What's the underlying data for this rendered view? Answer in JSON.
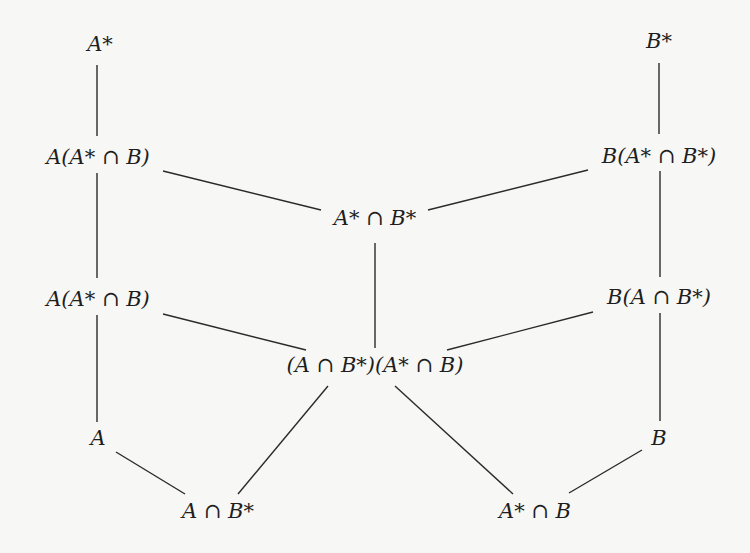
{
  "diagram": {
    "type": "hasse-diagram",
    "nodes": [
      {
        "id": "Astar",
        "label": "A*",
        "x": 100,
        "y": 44
      },
      {
        "id": "Bstar",
        "label": "B*",
        "x": 659,
        "y": 41
      },
      {
        "id": "A_AstarB",
        "label": "A(A* ∩ B)",
        "x": 98,
        "y": 157
      },
      {
        "id": "B_AstarBstar",
        "label": "B(A* ∩ B*)",
        "x": 659,
        "y": 156
      },
      {
        "id": "AstarBstar",
        "label": "A* ∩ B*",
        "x": 375,
        "y": 218
      },
      {
        "id": "A_AstarB_2",
        "label": "A(A* ∩ B)",
        "x": 98,
        "y": 299
      },
      {
        "id": "B_ABstar",
        "label": "B(A ∩ B*)",
        "x": 659,
        "y": 297
      },
      {
        "id": "middle",
        "label": "(A ∩ B*)(A* ∩ B)",
        "x": 375,
        "y": 365
      },
      {
        "id": "A",
        "label": "A",
        "x": 98,
        "y": 438
      },
      {
        "id": "B",
        "label": "B",
        "x": 659,
        "y": 438
      },
      {
        "id": "ABstar",
        "label": "A ∩ B*",
        "x": 218,
        "y": 511
      },
      {
        "id": "AstarB",
        "label": "A* ∩ B",
        "x": 535,
        "y": 511
      }
    ],
    "edges": [
      {
        "from": "Astar",
        "to": "A_AstarB",
        "x1": 97,
        "y1": 65,
        "x2": 97,
        "y2": 136
      },
      {
        "from": "Bstar",
        "to": "B_AstarBstar",
        "x1": 659,
        "y1": 63,
        "x2": 659,
        "y2": 134
      },
      {
        "from": "A_AstarB",
        "to": "AstarBstar",
        "x1": 163,
        "y1": 171,
        "x2": 321,
        "y2": 210
      },
      {
        "from": "B_AstarBstar",
        "to": "AstarBstar",
        "x1": 428,
        "y1": 210,
        "x2": 588,
        "y2": 170
      },
      {
        "from": "A_AstarB",
        "to": "A_AstarB_2",
        "x1": 97,
        "y1": 173,
        "x2": 97,
        "y2": 278
      },
      {
        "from": "B_AstarBstar",
        "to": "B_ABstar",
        "x1": 660,
        "y1": 171,
        "x2": 660,
        "y2": 277
      },
      {
        "from": "AstarBstar",
        "to": "middle",
        "x1": 375,
        "y1": 243,
        "x2": 375,
        "y2": 348
      },
      {
        "from": "A_AstarB_2",
        "to": "middle",
        "x1": 163,
        "y1": 314,
        "x2": 306,
        "y2": 350
      },
      {
        "from": "B_ABstar",
        "to": "middle",
        "x1": 447,
        "y1": 350,
        "x2": 593,
        "y2": 312
      },
      {
        "from": "A_AstarB_2",
        "to": "A",
        "x1": 97,
        "y1": 315,
        "x2": 97,
        "y2": 422
      },
      {
        "from": "B_ABstar",
        "to": "B",
        "x1": 660,
        "y1": 313,
        "x2": 660,
        "y2": 421
      },
      {
        "from": "A",
        "to": "ABstar",
        "x1": 116,
        "y1": 452,
        "x2": 185,
        "y2": 494
      },
      {
        "from": "middle",
        "to": "ABstar",
        "x1": 238,
        "y1": 494,
        "x2": 328,
        "y2": 386
      },
      {
        "from": "middle",
        "to": "AstarB",
        "x1": 395,
        "y1": 386,
        "x2": 513,
        "y2": 494
      },
      {
        "from": "B",
        "to": "AstarB",
        "x1": 642,
        "y1": 450,
        "x2": 569,
        "y2": 493
      }
    ]
  }
}
